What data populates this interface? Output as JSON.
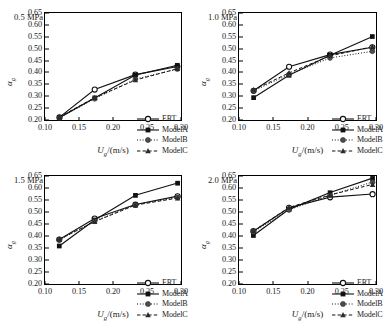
{
  "figure": {
    "xlabel_main": "U",
    "xlabel_sub": "g",
    "xlabel_unit": "/(m/s)",
    "ylabel_main": "α",
    "ylabel_sub": "g"
  },
  "legend": {
    "items": [
      {
        "label": "ERT",
        "marker": "open-circle",
        "line": "solid"
      },
      {
        "label": "ModelA",
        "marker": "filled-square",
        "line": "solid"
      },
      {
        "label": "ModelB",
        "marker": "filled-circle",
        "line": "dotted"
      },
      {
        "label": "ModelC",
        "marker": "filled-triangle",
        "line": "dashed"
      }
    ]
  },
  "axis": {
    "xlim": [
      0.1,
      0.3
    ],
    "ylim": [
      0.2,
      0.65
    ],
    "xticks": [
      "0.10",
      "0.15",
      "0.20",
      "0.25",
      "0.30"
    ],
    "xtick_values": [
      0.1,
      0.15,
      0.2,
      0.25,
      0.3
    ],
    "yticks": [
      "0.20",
      "0.25",
      "0.30",
      "0.35",
      "0.40",
      "0.45",
      "0.50",
      "0.55",
      "0.60",
      "0.65"
    ],
    "ytick_values": [
      0.2,
      0.25,
      0.3,
      0.35,
      0.4,
      0.45,
      0.5,
      0.55,
      0.6,
      0.65
    ]
  },
  "chart_data": [
    {
      "type": "line",
      "title": "0.5 MPa",
      "xlabel": "Ug/(m/s)",
      "ylabel": "αg",
      "xlim": [
        0.1,
        0.3
      ],
      "ylim": [
        0.2,
        0.65
      ],
      "grid": false,
      "legend_position": "bottom-right",
      "x": [
        0.121,
        0.173,
        0.233,
        0.295
      ],
      "series": [
        {
          "name": "ERT",
          "values": [
            0.211,
            0.328,
            0.391,
            0.425
          ]
        },
        {
          "name": "ModelA",
          "values": [
            0.21,
            0.293,
            0.389,
            0.43
          ]
        },
        {
          "name": "ModelB",
          "values": [
            0.209,
            0.289,
            0.372,
            0.414
          ]
        },
        {
          "name": "ModelC",
          "values": [
            0.212,
            0.294,
            0.368,
            0.416
          ]
        }
      ]
    },
    {
      "type": "line",
      "title": "1.0 MPa",
      "xlabel": "Ug/(m/s)",
      "ylabel": "αg",
      "xlim": [
        0.1,
        0.3
      ],
      "ylim": [
        0.2,
        0.65
      ],
      "grid": false,
      "legend_position": "bottom-right",
      "x": [
        0.121,
        0.173,
        0.233,
        0.295
      ],
      "series": [
        {
          "name": "ERT",
          "values": [
            0.323,
            0.424,
            0.475,
            0.506
          ]
        },
        {
          "name": "ModelA",
          "values": [
            0.294,
            0.388,
            0.472,
            0.551
          ]
        },
        {
          "name": "ModelB",
          "values": [
            0.322,
            0.392,
            0.461,
            0.489
          ]
        },
        {
          "name": "ModelC",
          "values": [
            0.326,
            0.398,
            0.47,
            0.508
          ]
        }
      ]
    },
    {
      "type": "line",
      "title": "1.5 MPa",
      "xlabel": "Ug/(m/s)",
      "ylabel": "αg",
      "xlim": [
        0.1,
        0.3
      ],
      "ylim": [
        0.2,
        0.65
      ],
      "grid": false,
      "legend_position": "bottom-right",
      "x": [
        0.121,
        0.173,
        0.233,
        0.295
      ],
      "series": [
        {
          "name": "ERT",
          "values": [
            0.385,
            0.473,
            0.531,
            0.566
          ]
        },
        {
          "name": "ModelA",
          "values": [
            0.358,
            0.467,
            0.57,
            0.621
          ]
        },
        {
          "name": "ModelB",
          "values": [
            0.384,
            0.462,
            0.53,
            0.561
          ]
        },
        {
          "name": "ModelC",
          "values": [
            0.386,
            0.46,
            0.529,
            0.558
          ]
        }
      ]
    },
    {
      "type": "line",
      "title": "2.0 MPa",
      "xlabel": "Ug/(m/s)",
      "ylabel": "αg",
      "xlim": [
        0.1,
        0.3
      ],
      "ylim": [
        0.2,
        0.65
      ],
      "grid": false,
      "legend_position": "bottom-right",
      "x": [
        0.121,
        0.173,
        0.233,
        0.295
      ],
      "series": [
        {
          "name": "ERT",
          "values": [
            0.42,
            0.518,
            0.562,
            0.575
          ]
        },
        {
          "name": "ModelA",
          "values": [
            0.402,
            0.511,
            0.581,
            0.641
          ]
        },
        {
          "name": "ModelB",
          "values": [
            0.417,
            0.509,
            0.57,
            0.625
          ]
        },
        {
          "name": "ModelC",
          "values": [
            0.421,
            0.519,
            0.571,
            0.615
          ]
        }
      ]
    }
  ]
}
